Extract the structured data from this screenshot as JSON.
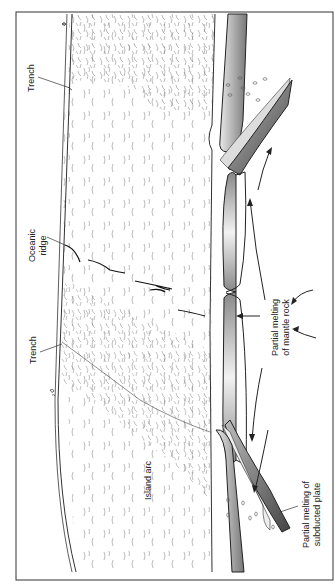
{
  "diagram": {
    "type": "geological cross-section (rotated 90° counter-clockwise)",
    "colors": {
      "frame": "#333333",
      "plate_dark": "#555555",
      "plate_light": "#e6e6e6",
      "line": "#333333",
      "background": "#ffffff"
    },
    "labels": {
      "trench_top": "Trench",
      "oceanic_ridge_1": "Oceanic",
      "oceanic_ridge_2": "ridge",
      "trench_bottom": "Trench",
      "partial_melting_mantle_1": "Partial melting",
      "partial_melting_mantle_2": "of mantle rock",
      "island_arc": "Island arc",
      "partial_melting_plate_1": "Partial melting of",
      "partial_melting_plate_2": "subducted plate"
    }
  }
}
